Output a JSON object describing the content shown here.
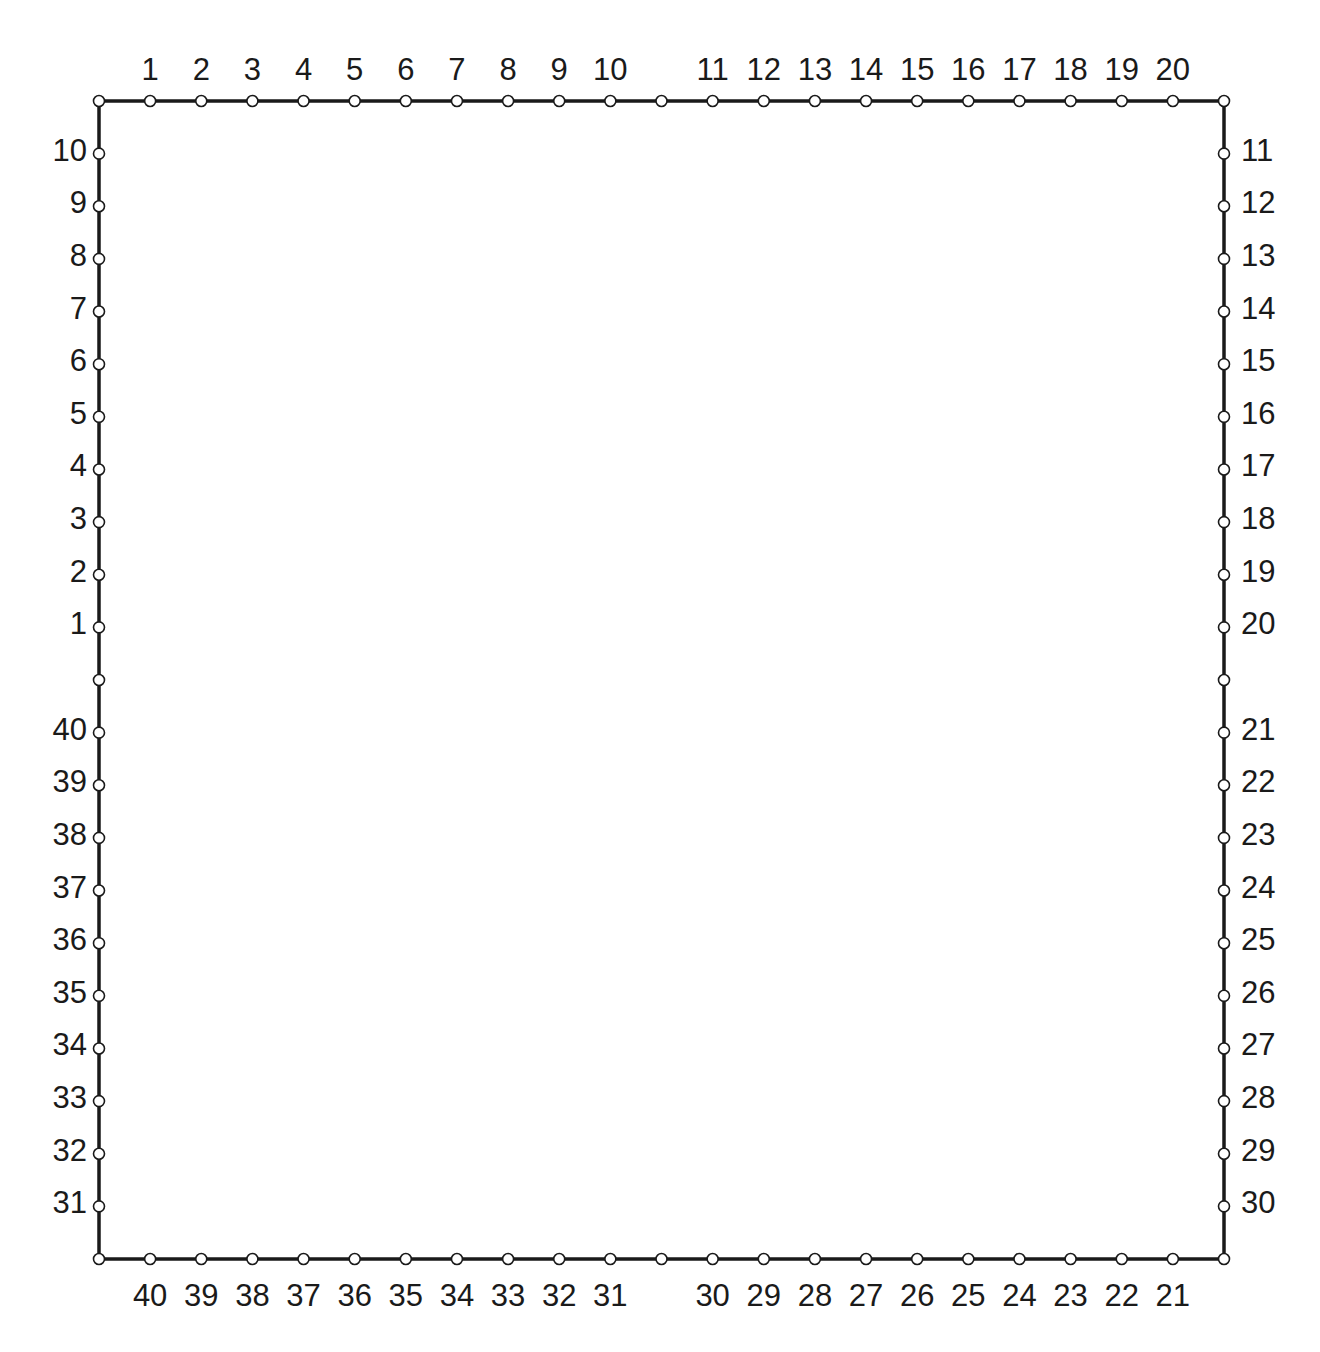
{
  "diagram": {
    "type": "pin-frame",
    "frame": {
      "x0": 99,
      "y0": 101,
      "x1": 1224,
      "y1": 1259,
      "stroke": "#1a1a1a",
      "stroke_width": 3.5
    },
    "node": {
      "radius": 5.5,
      "fill": "#ffffff",
      "stroke": "#1a1a1a"
    },
    "segments_per_side": 22,
    "sides": {
      "top": {
        "labels": [
          "1",
          "2",
          "3",
          "4",
          "5",
          "6",
          "7",
          "8",
          "9",
          "10",
          "",
          "11",
          "12",
          "13",
          "14",
          "15",
          "16",
          "17",
          "18",
          "19",
          "20"
        ]
      },
      "left": {
        "labels_top_to_bottom": [
          "10",
          "9",
          "8",
          "7",
          "6",
          "5",
          "4",
          "3",
          "2",
          "1",
          "",
          "40",
          "39",
          "38",
          "37",
          "36",
          "35",
          "34",
          "33",
          "32",
          "31"
        ]
      },
      "right": {
        "labels_top_to_bottom": [
          "11",
          "12",
          "13",
          "14",
          "15",
          "16",
          "17",
          "18",
          "19",
          "20",
          "",
          "21",
          "22",
          "23",
          "24",
          "25",
          "26",
          "27",
          "28",
          "29",
          "30"
        ]
      },
      "bottom": {
        "labels": [
          "40",
          "39",
          "38",
          "37",
          "36",
          "35",
          "34",
          "33",
          "32",
          "31",
          "",
          "30",
          "29",
          "28",
          "27",
          "26",
          "25",
          "24",
          "23",
          "22",
          "21"
        ]
      }
    }
  }
}
